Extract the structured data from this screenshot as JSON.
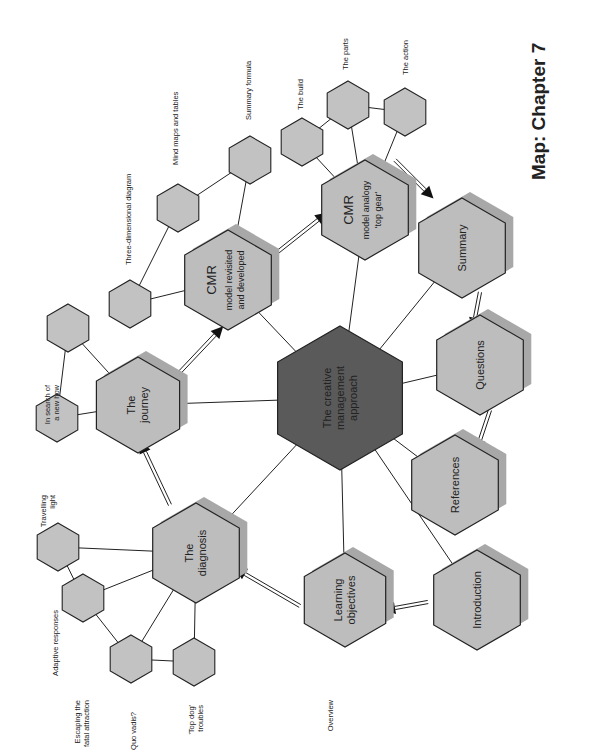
{
  "title": "Map: Chapter 7",
  "center": {
    "lines": [
      "The creative",
      "management",
      "approach"
    ]
  },
  "main_nodes": {
    "introduction": {
      "lines": [
        "Introduction"
      ]
    },
    "learning_objectives": {
      "lines": [
        "Learning",
        "objectives"
      ]
    },
    "diagnosis": {
      "lines": [
        "The",
        "diagnosis"
      ]
    },
    "journey": {
      "lines": [
        "The",
        "journey"
      ]
    },
    "cmr_revisited": {
      "lines": [
        "CMR",
        "model revisited",
        "and developed"
      ]
    },
    "cmr_analogy": {
      "lines": [
        "CMR",
        "model analogy",
        "'top gear'"
      ]
    },
    "summary": {
      "lines": [
        "Summary"
      ]
    },
    "questions": {
      "lines": [
        "Questions"
      ]
    },
    "references": {
      "lines": [
        "References"
      ]
    }
  },
  "leaf_labels": {
    "overview": "Overview",
    "top_dog": [
      "'Top dog'",
      "troubles"
    ],
    "quo_vadis": "Quo vadis?",
    "escaping": [
      "Escaping the",
      "fatal attraction"
    ],
    "adaptive": "Adaptive responses",
    "travelling": [
      "Travelling",
      "light"
    ],
    "search": [
      "In search of",
      "a new how"
    ],
    "three_d": "Three-dimensional diagram",
    "mind_maps": "Mind maps and tables",
    "summary_formula": "Summary formula",
    "build": "The build",
    "parts": "The parts",
    "action": "The action"
  },
  "colors": {
    "node_fill": "#bdbdbd",
    "leaf_fill": "#c2c2c2",
    "center_fill": "#5a5a5a",
    "shadow": "#a8a8a8",
    "line": "#222222"
  }
}
